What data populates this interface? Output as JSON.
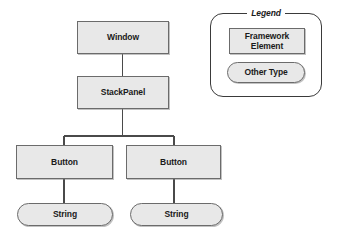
{
  "diagram": {
    "type": "tree",
    "nodes": [
      {
        "id": "window",
        "label": "Window",
        "shape": "rect",
        "category": "framework-element"
      },
      {
        "id": "stackpanel",
        "label": "StackPanel",
        "shape": "rect",
        "category": "framework-element"
      },
      {
        "id": "button-left",
        "label": "Button",
        "shape": "rect",
        "category": "framework-element"
      },
      {
        "id": "button-right",
        "label": "Button",
        "shape": "rect",
        "category": "framework-element"
      },
      {
        "id": "string-left",
        "label": "String",
        "shape": "pill",
        "category": "other-type"
      },
      {
        "id": "string-right",
        "label": "String",
        "shape": "pill",
        "category": "other-type"
      }
    ],
    "edges": [
      {
        "from": "window",
        "to": "stackpanel"
      },
      {
        "from": "stackpanel",
        "to": "button-left"
      },
      {
        "from": "stackpanel",
        "to": "button-right"
      },
      {
        "from": "button-left",
        "to": "string-left"
      },
      {
        "from": "button-right",
        "to": "string-right"
      }
    ]
  },
  "legend": {
    "title": "Legend",
    "items": [
      {
        "id": "framework-element",
        "label_line1": "Framework",
        "label_line2": "Element",
        "shape": "rect"
      },
      {
        "id": "other-type",
        "label": "Other Type",
        "shape": "pill"
      }
    ]
  },
  "colors": {
    "node_fill": "#e8e8e8",
    "node_border": "#6b6b6b",
    "legend_border": "#3a3a3a",
    "connector": "#4a4a4a",
    "text": "#1a1a1a",
    "background": "#ffffff"
  }
}
